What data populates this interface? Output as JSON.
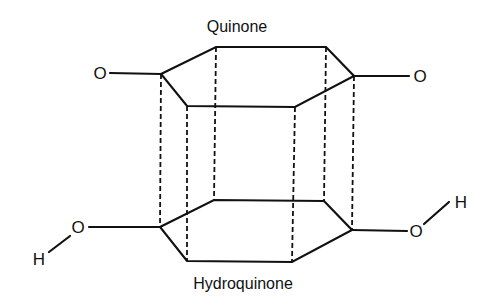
{
  "diagram": {
    "type": "molecular-relationship",
    "top_label": "Quinone",
    "bottom_label": "Hydroquinone",
    "top_substituents": [
      {
        "atom": "O",
        "side": "left"
      },
      {
        "atom": "O",
        "side": "right"
      }
    ],
    "bottom_substituents": [
      {
        "atom": "O",
        "hydrogen": "H",
        "side": "left"
      },
      {
        "atom": "O",
        "hydrogen": "H",
        "side": "right"
      }
    ],
    "connections": "dashed vertical lines link each vertex of the quinone ring to the corresponding vertex of the hydroquinone ring"
  },
  "atoms": {
    "o_top_left": "O",
    "o_top_right": "O",
    "o_bottom_left": "O",
    "h_bottom_left": "H",
    "o_bottom_right": "O",
    "h_bottom_right": "H"
  }
}
